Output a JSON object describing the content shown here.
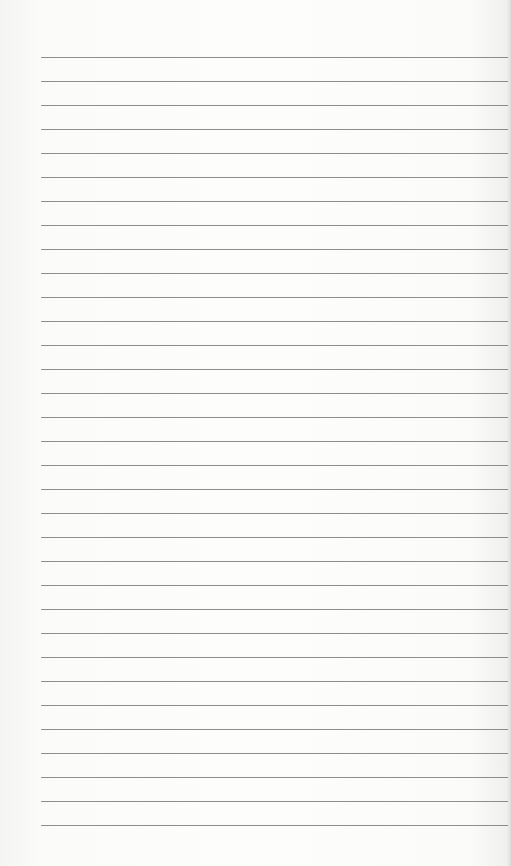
{
  "page": {
    "type": "lined-paper",
    "background_color": "#fcfcfb",
    "line_color": "#7a7a7a",
    "rules": {
      "count": 33,
      "first_y": 57,
      "spacing": 24,
      "left_x": 41,
      "right_x": 508
    }
  }
}
